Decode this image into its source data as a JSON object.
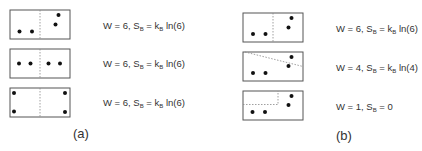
{
  "colors": {
    "box_stroke": "#555555",
    "divider": "#888888",
    "dot": "#111111"
  },
  "panels": [
    {
      "label": "(a)",
      "rows": [
        {
          "W": "6",
          "equation": {
            "lhs": "W = 6, S",
            "sub1": "B",
            "mid": " = k",
            "sub2": "B",
            "rhs": " ln(6)"
          }
        },
        {
          "W": "6",
          "equation": {
            "lhs": "W = 6, S",
            "sub1": "B",
            "mid": " = k",
            "sub2": "B",
            "rhs": " ln(6)"
          }
        },
        {
          "W": "6",
          "equation": {
            "lhs": "W = 6, S",
            "sub1": "B",
            "mid": " = k",
            "sub2": "B",
            "rhs": " ln(6)"
          }
        }
      ]
    },
    {
      "label": "(b)",
      "rows": [
        {
          "W": "6",
          "equation": {
            "lhs": "W = 6, S",
            "sub1": "B",
            "mid": " = k",
            "sub2": "B",
            "rhs": " ln(6)"
          }
        },
        {
          "W": "4",
          "equation": {
            "lhs": "W = 4, S",
            "sub1": "B",
            "mid": " = k",
            "sub2": "B",
            "rhs": " ln(4)"
          }
        },
        {
          "W": "1",
          "equation": {
            "lhs": "W = 1, S",
            "sub1": "B",
            "mid": " = 0",
            "sub2": "",
            "rhs": ""
          }
        }
      ]
    }
  ]
}
